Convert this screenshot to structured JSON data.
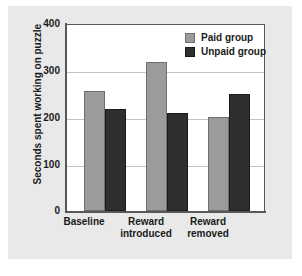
{
  "chart_data": {
    "type": "bar",
    "title": "",
    "xlabel": "",
    "ylabel": "Seconds spent working on puzzle",
    "ylim": [
      0,
      400
    ],
    "yticks": [
      0,
      100,
      200,
      300,
      400
    ],
    "ytick_labels": [
      "0",
      "100",
      "200",
      "300",
      "400"
    ],
    "grid": true,
    "legend_position": "top-right",
    "categories": [
      "Baseline",
      "Reward introduced",
      "Reward removed"
    ],
    "category_lines": [
      [
        "Baseline"
      ],
      [
        "Reward",
        "introduced"
      ],
      [
        "Reward",
        "removed"
      ]
    ],
    "series": [
      {
        "name": "Paid group",
        "color": "#9b9b9b",
        "values": [
          258,
          320,
          202
        ]
      },
      {
        "name": "Unpaid group",
        "color": "#2f2f2f",
        "values": [
          219,
          210,
          251
        ]
      }
    ]
  },
  "legend": {
    "items": [
      {
        "label": "Paid group"
      },
      {
        "label": "Unpaid group"
      }
    ]
  },
  "colors": {
    "paid": "#9b9b9b",
    "unpaid": "#2f2f2f",
    "figure_background": "#e9e9e9",
    "plot_background": "#ffffff",
    "axis": "#58585a",
    "gridline": "#c3c3c5",
    "text": "#1a1a1a"
  }
}
